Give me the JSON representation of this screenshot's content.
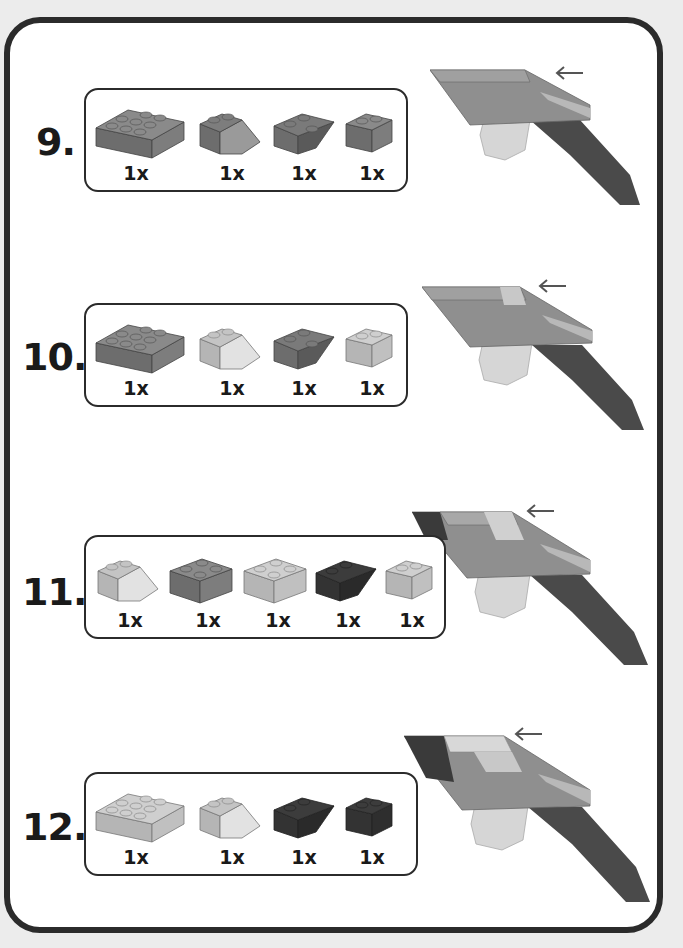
{
  "colors": {
    "frame": "#2b2b2b",
    "background": "#ececec",
    "panel": "#ffffff",
    "dark_gray": "#6d6d6d",
    "medium_gray": "#8f8f8f",
    "light_gray": "#c4c4c4",
    "very_light": "#dedede",
    "black_brick": "#3a3a3a",
    "arrow": "#555555"
  },
  "steps": [
    {
      "number": "9.",
      "parts": [
        {
          "type": "brick-2x4",
          "color": "medium",
          "qty": "1x"
        },
        {
          "type": "slope-2x2",
          "color": "medium",
          "qty": "1x"
        },
        {
          "type": "inverted-slope-2x2",
          "color": "medium",
          "qty": "1x"
        },
        {
          "type": "brick-1x2",
          "color": "medium",
          "qty": "1x"
        }
      ]
    },
    {
      "number": "10.",
      "parts": [
        {
          "type": "brick-2x4",
          "color": "medium",
          "qty": "1x"
        },
        {
          "type": "slope-2x2",
          "color": "light",
          "qty": "1x"
        },
        {
          "type": "inverted-slope-2x2",
          "color": "medium",
          "qty": "1x"
        },
        {
          "type": "brick-1x2",
          "color": "light",
          "qty": "1x"
        }
      ]
    },
    {
      "number": "11.",
      "parts": [
        {
          "type": "slope-2x2",
          "color": "light",
          "qty": "1x"
        },
        {
          "type": "brick-2x2",
          "color": "medium",
          "qty": "1x"
        },
        {
          "type": "brick-2x2",
          "color": "light",
          "qty": "1x"
        },
        {
          "type": "inverted-slope-2x2",
          "color": "black",
          "qty": "1x"
        },
        {
          "type": "brick-1x2",
          "color": "light",
          "qty": "1x"
        }
      ]
    },
    {
      "number": "12.",
      "parts": [
        {
          "type": "brick-2x4",
          "color": "light",
          "qty": "1x"
        },
        {
          "type": "slope-2x2",
          "color": "light",
          "qty": "1x"
        },
        {
          "type": "inverted-slope-2x2",
          "color": "black",
          "qty": "1x"
        },
        {
          "type": "brick-1x2",
          "color": "black",
          "qty": "1x"
        }
      ]
    }
  ],
  "icons": {
    "placement_arrow": "left-arrow-icon"
  }
}
